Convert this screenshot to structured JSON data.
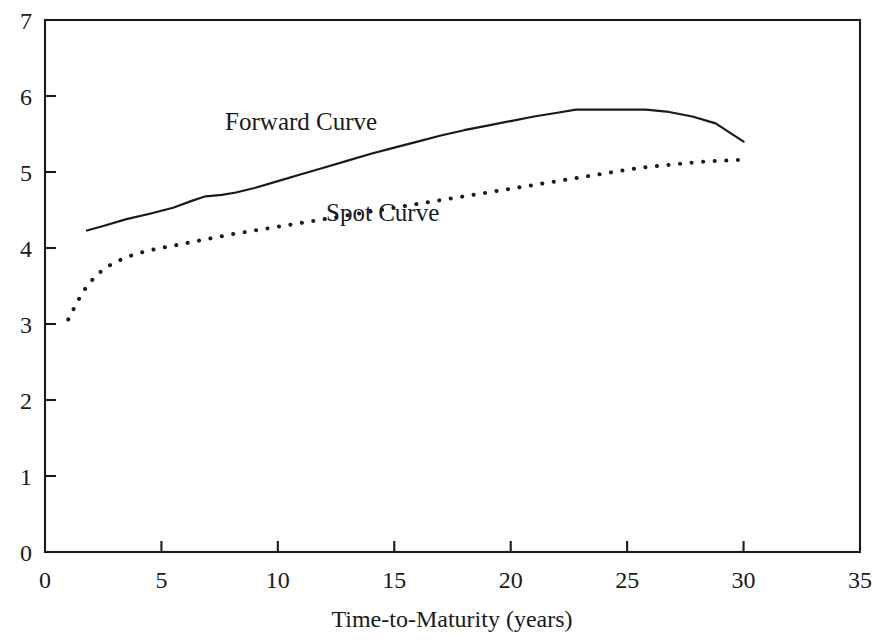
{
  "chart_data": {
    "type": "line",
    "title": "",
    "subtitle": "",
    "xlabel": "Time-to-Maturity (years)",
    "ylabel": "",
    "xlim": [
      0,
      35
    ],
    "ylim": [
      0,
      7
    ],
    "xticks": [
      0,
      5,
      10,
      15,
      20,
      25,
      30,
      35
    ],
    "xtick_labels": [
      "0",
      "5",
      "10",
      "15",
      "20",
      "25",
      "30",
      "35"
    ],
    "yticks": [
      0,
      1,
      2,
      3,
      4,
      5,
      6,
      7
    ],
    "ytick_labels": [
      "0",
      "1",
      "2",
      "3",
      "4",
      "5",
      "6",
      "7"
    ],
    "grid": false,
    "legend_position": "inline-annotation",
    "frame": "box",
    "series": [
      {
        "name": "Forward Curve",
        "style": "solid",
        "color": "#1a1a1a",
        "label_x": 11.0,
        "label_y": 5.55,
        "x": [
          1.8,
          2.5,
          3.5,
          4.5,
          5.5,
          6.3,
          6.9,
          7.6,
          8.2,
          9.0,
          10.0,
          11.0,
          12.0,
          13.0,
          14.0,
          15.0,
          16.0,
          17.0,
          18.0,
          19.0,
          20.0,
          21.0,
          22.0,
          22.8,
          24.0,
          25.0,
          25.8,
          26.8,
          27.8,
          28.8,
          30.0
        ],
        "y": [
          4.23,
          4.29,
          4.38,
          4.45,
          4.53,
          4.62,
          4.68,
          4.7,
          4.73,
          4.79,
          4.88,
          4.97,
          5.06,
          5.15,
          5.24,
          5.32,
          5.4,
          5.48,
          5.55,
          5.61,
          5.67,
          5.73,
          5.78,
          5.82,
          5.82,
          5.82,
          5.82,
          5.79,
          5.73,
          5.64,
          5.4
        ]
      },
      {
        "name": "Spot Curve",
        "style": "dotted",
        "color": "#1a1a1a",
        "label_x": 14.5,
        "label_y": 4.35,
        "x": [
          1.0,
          1.4,
          1.8,
          2.2,
          2.6,
          3.0,
          3.5,
          4.0,
          4.5,
          5.0,
          5.5,
          6.0,
          6.5,
          7.0,
          7.5,
          8.0,
          9.0,
          10.0,
          11.0,
          12.0,
          13.0,
          14.0,
          15.0,
          16.0,
          17.0,
          18.0,
          19.0,
          20.0,
          21.0,
          22.0,
          23.0,
          24.0,
          25.0,
          26.0,
          27.0,
          28.0,
          29.0,
          30.0
        ],
        "y": [
          3.06,
          3.3,
          3.5,
          3.64,
          3.74,
          3.81,
          3.88,
          3.93,
          3.97,
          4.0,
          4.03,
          4.06,
          4.09,
          4.12,
          4.15,
          4.18,
          4.23,
          4.28,
          4.33,
          4.38,
          4.43,
          4.48,
          4.53,
          4.58,
          4.63,
          4.68,
          4.73,
          4.78,
          4.83,
          4.88,
          4.93,
          4.98,
          5.03,
          5.07,
          5.1,
          5.13,
          5.15,
          5.16
        ]
      }
    ]
  },
  "axis": {
    "x_title": "Time-to-Maturity (years)",
    "x_tick_labels": [
      "0",
      "5",
      "10",
      "15",
      "20",
      "25",
      "30",
      "35"
    ],
    "y_tick_labels": [
      "0",
      "1",
      "2",
      "3",
      "4",
      "5",
      "6",
      "7"
    ]
  },
  "annotations": {
    "forward_label": "Forward Curve",
    "spot_label": "Spot Curve"
  },
  "colors": {
    "ink": "#1a1a1a",
    "background": "#ffffff"
  }
}
